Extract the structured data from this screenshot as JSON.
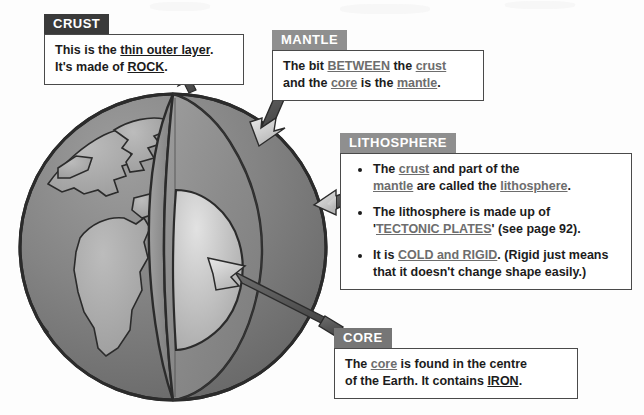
{
  "colors": {
    "header_dark": "#3a3a3a",
    "header_mid": "#8f8f8f",
    "header_gray": "#767676",
    "box_border": "#4a4a4a",
    "ocean": "#7b7b7b",
    "land": "#a8a8a8",
    "mantle_face": "#8d8d8d",
    "crust_band": "#9a9a9a",
    "core": "#bfbfbf",
    "outline": "#2b2b2b",
    "arrow_head": "#cfcfcf",
    "arrow_shaft": "#5a5a5a"
  },
  "callouts": {
    "crust": {
      "header": "CRUST",
      "header_color": "#3a3a3a",
      "line1_a": "This is the ",
      "line1_b": "thin outer layer",
      "line1_c": ".",
      "line2_a": "It's made of ",
      "line2_b": "ROCK",
      "line2_c": "."
    },
    "mantle": {
      "header": "MANTLE",
      "header_color": "#8f8f8f",
      "line1_a": "The bit ",
      "line1_b": "BETWEEN",
      "line1_c": " the ",
      "line1_d": "crust",
      "line2_a": "and the ",
      "line2_b": "core",
      "line2_c": " is the ",
      "line2_d": "mantle",
      "line2_e": "."
    },
    "lithosphere": {
      "header": "LITHOSPHERE",
      "header_color": "#8f8f8f",
      "bullet1_a": "The ",
      "bullet1_b": "crust",
      "bullet1_c": " and part of the",
      "bullet1_d": "mantle",
      "bullet1_e": " are called the ",
      "bullet1_f": "lithosphere",
      "bullet1_g": ".",
      "bullet2_a": "The lithosphere is made up of",
      "bullet2_b": "'",
      "bullet2_c": "TECTONIC PLATES",
      "bullet2_d": "' (see page 92).",
      "bullet3_a": "It is ",
      "bullet3_b": "COLD and RIGID",
      "bullet3_c": ".  (Rigid just means",
      "bullet3_d": "that it doesn't change shape easily.)"
    },
    "core": {
      "header": "CORE",
      "header_color": "#767676",
      "line1_a": "The ",
      "line1_b": "core",
      "line1_c": " is found in the centre",
      "line2_a": "of the Earth.  It contains ",
      "line2_b": "IRON",
      "line2_c": "."
    }
  },
  "diagram": {
    "name": "earth-cutaway",
    "layers": [
      {
        "name": "ocean-sphere",
        "label": "Earth sphere surface"
      },
      {
        "name": "continents",
        "label": "Continents"
      },
      {
        "name": "crust-band",
        "label": "Crust cut band"
      },
      {
        "name": "mantle-face",
        "label": "Mantle cut face"
      },
      {
        "name": "core-sphere",
        "label": "Core"
      }
    ],
    "arrows": [
      {
        "name": "crust-arrow",
        "points_to": "crust"
      },
      {
        "name": "mantle-arrow",
        "points_to": "mantle"
      },
      {
        "name": "lithosphere-arrow",
        "points_to": "lithosphere"
      },
      {
        "name": "core-arrow",
        "points_to": "core"
      }
    ]
  }
}
